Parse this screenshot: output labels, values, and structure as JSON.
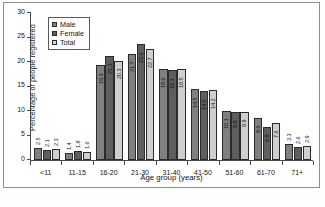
{
  "figure": {
    "y_axis_title": "Percentage of people registered",
    "x_axis_title": "Age group (years)",
    "y_ticks": [
      "0",
      "5",
      "10",
      "15",
      "20",
      "25",
      "30"
    ],
    "caption_fragment": "Source:"
  },
  "legend": {
    "position": "top-left-inside",
    "items": [
      {
        "label": "Male",
        "color": "#808080"
      },
      {
        "label": "Female",
        "color": "#5e5e5e"
      },
      {
        "label": "Total",
        "color": "#d6d6d6"
      }
    ]
  },
  "chart_data": {
    "type": "bar",
    "title": "",
    "xlabel": "Age group (years)",
    "ylabel": "Percentage of people registered",
    "ylim": [
      0,
      30
    ],
    "ytick_step": 5,
    "grid": false,
    "legend_position": "upper left",
    "categories": [
      "<11",
      "11-15",
      "16-20",
      "21-30",
      "31-40",
      "41-50",
      "51-60",
      "61-70",
      "71+"
    ],
    "series": [
      {
        "name": "Male",
        "color": "#808080",
        "values": [
          2.5,
          1.4,
          19.3,
          21.7,
          18.6,
          14.5,
          10.1,
          8.6,
          3.3
        ]
      },
      {
        "name": "Female",
        "color": "#5e5e5e",
        "values": [
          2.1,
          1.8,
          21.3,
          23.6,
          18.3,
          14.0,
          9.8,
          6.8,
          2.6
        ]
      },
      {
        "name": "Total",
        "color": "#cfcfcf",
        "values": [
          2.3,
          1.6,
          20.3,
          22.7,
          18.5,
          14.2,
          9.9,
          7.6,
          2.9
        ]
      }
    ],
    "value_labels": {
      "shown": true,
      "orientation": "vertical",
      "formatted": [
        [
          "2.5",
          "2.1",
          "2.3"
        ],
        [
          "1.4",
          "1.8",
          "1.6"
        ],
        [
          "19.3",
          "21.3",
          "20.3"
        ],
        [
          "21.7",
          "23.6",
          "22.7"
        ],
        [
          "18.6",
          "18.3",
          "18.5"
        ],
        [
          "14.5",
          "14.0",
          "14.2"
        ],
        [
          "10.1",
          "9.8",
          "9.9"
        ],
        [
          "8.6",
          "6.8",
          "7.6"
        ],
        [
          "3.3",
          "2.6",
          "2.9"
        ]
      ]
    }
  }
}
